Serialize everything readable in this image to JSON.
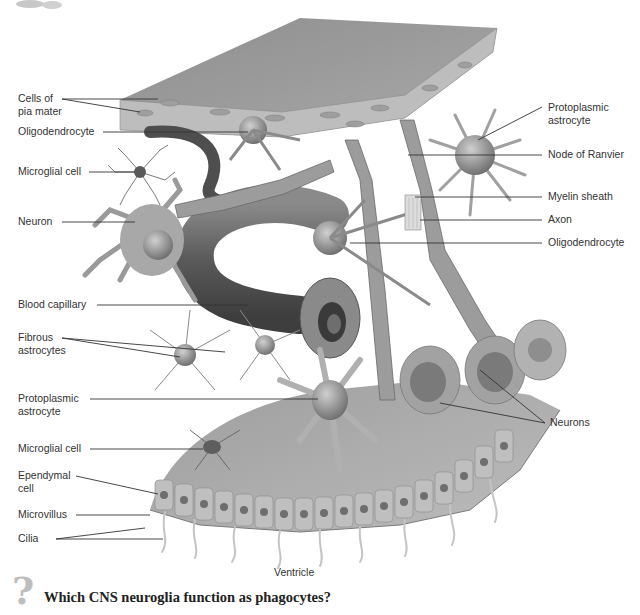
{
  "figure": {
    "background": "#ffffff",
    "colors": {
      "tissue_dark": "#6e6e6e",
      "tissue_mid": "#9a9a9a",
      "tissue_light": "#c8c8c8",
      "leader_line": "#333333",
      "label_text": "#333333"
    }
  },
  "labels": {
    "left": [
      {
        "id": "pia",
        "text": "Cells of\npia mater"
      },
      {
        "id": "oligo1",
        "text": "Oligodendrocyte"
      },
      {
        "id": "microglia1",
        "text": "Microglial cell"
      },
      {
        "id": "neuron",
        "text": "Neuron"
      },
      {
        "id": "capillary",
        "text": "Blood capillary"
      },
      {
        "id": "fibrous",
        "text": "Fibrous\nastrocytes"
      },
      {
        "id": "proto_left",
        "text": "Protoplasmic\nastrocyte"
      },
      {
        "id": "microglia2",
        "text": "Microglial cell"
      },
      {
        "id": "ependymal",
        "text": "Ependymal\ncell"
      },
      {
        "id": "microvillus",
        "text": "Microvillus"
      },
      {
        "id": "cilia",
        "text": "Cilia"
      }
    ],
    "right": [
      {
        "id": "proto_right",
        "text": "Protoplasmic\nastrocyte"
      },
      {
        "id": "ranvier",
        "text": "Node of Ranvier"
      },
      {
        "id": "myelin",
        "text": "Myelin sheath"
      },
      {
        "id": "axon",
        "text": "Axon"
      },
      {
        "id": "oligo2",
        "text": "Oligodendrocyte"
      },
      {
        "id": "neurons",
        "text": "Neurons"
      }
    ],
    "bottom": {
      "ventricle": "Ventricle"
    }
  },
  "question": {
    "icon": "question-mark-icon",
    "text": "Which CNS neuroglia function as phagocytes?"
  }
}
